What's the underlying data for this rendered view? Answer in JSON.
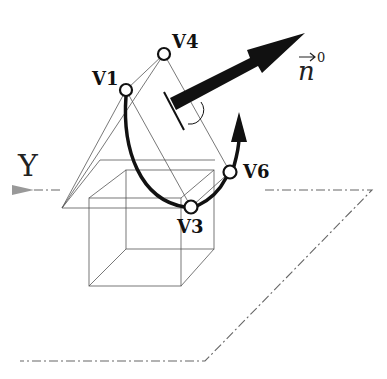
{
  "diagram": {
    "axis_label": "Y",
    "normal_vector": {
      "symbol": "n",
      "superscript": "0",
      "has_vector_arrow": true
    },
    "vertices": [
      {
        "id": "v1",
        "label": "V1"
      },
      {
        "id": "v4",
        "label": "V4"
      },
      {
        "id": "v3",
        "label": "V3"
      },
      {
        "id": "v6",
        "label": "V6"
      }
    ],
    "elements": [
      "wireframe-cube",
      "wireframe-pyramid",
      "curve-v1-v3-v6",
      "normal-arrow",
      "tangent-arrow",
      "ground-plane-dashdot",
      "y-axis-arrow",
      "right-angle-marker"
    ],
    "colors": {
      "stroke": "#111111",
      "wire": "#555555",
      "dashdot": "#666666",
      "background": "#ffffff"
    }
  }
}
